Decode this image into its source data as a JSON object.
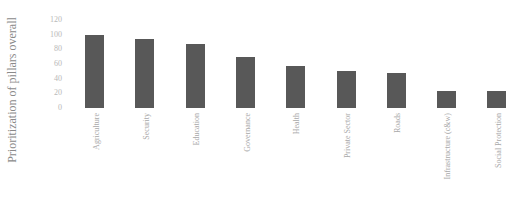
{
  "chart_data": {
    "type": "bar",
    "title": "",
    "xlabel": "",
    "ylabel": "Prioritization of pillars overall",
    "ylim": [
      0,
      120
    ],
    "yticks": [
      0,
      20,
      40,
      60,
      80,
      100,
      120
    ],
    "grid": false,
    "legend": null,
    "categories": [
      "Agriculture",
      "Security",
      "Education",
      "Governance",
      "Health",
      "Private Sector",
      "Roads",
      "Infrastructure (c&w)",
      "Social Protection"
    ],
    "values": [
      100,
      94,
      87,
      70,
      57,
      51,
      48,
      23,
      23
    ],
    "bar_color": "#585858"
  }
}
